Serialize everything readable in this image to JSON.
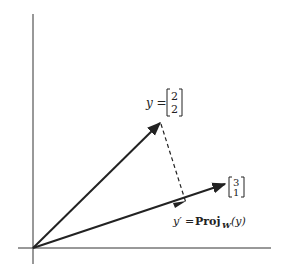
{
  "diagram": {
    "vector_y": {
      "label_lhs": "y =",
      "components": [
        "2",
        "2"
      ]
    },
    "vector_w": {
      "components": [
        "3",
        "1"
      ]
    },
    "projection": {
      "lhs": "y′",
      "eq": "=",
      "op": "Proj",
      "subscript": "W",
      "arg": "(y)"
    },
    "colors": {
      "ink": "#222222",
      "background": "#ffffff"
    }
  }
}
